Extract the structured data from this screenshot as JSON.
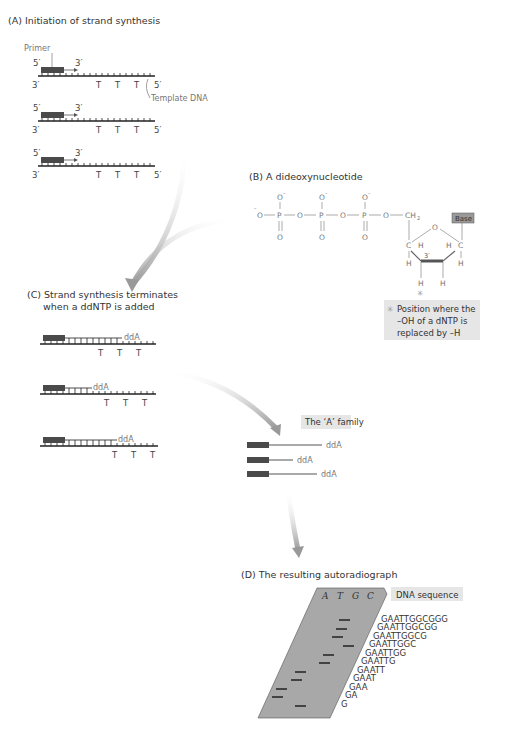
{
  "panels": {
    "A": {
      "title": "(A) Initiation of strand synthesis",
      "primer_label": "Primer",
      "template_label": "Template DNA",
      "five_prime": "5′",
      "three_prime": "3′",
      "template_bases": [
        "T",
        "T",
        "T"
      ],
      "strand_count": 3
    },
    "B": {
      "title": "(B) A dideoxynucleotide",
      "atoms": {
        "O": "O",
        "O_minus": "O",
        "P": "P",
        "CH2": "CH",
        "C": "C",
        "H": "H",
        "three_prime": "3′"
      },
      "base_label": "Base",
      "asterisk": "✳",
      "note_lines": [
        "Position where the",
        "–OH of a dNTP is",
        "replaced by –H"
      ]
    },
    "C": {
      "title_line1": "(C) Strand synthesis terminates",
      "title_line2": "when a ddNTP is added",
      "terminator": "ddA",
      "template_bases": [
        "T",
        "T",
        "T"
      ]
    },
    "family": {
      "title": "The ‘A’ family",
      "fragments": [
        "ddA",
        "ddA",
        "ddA"
      ]
    },
    "D": {
      "title": "(D) The resulting autoradiograph",
      "lanes": [
        "A",
        "T",
        "G",
        "C"
      ],
      "sequence_label": "DNA sequence",
      "ladder": [
        "GAATTGGCGGG",
        "GAATTGGCGG",
        "GAATTGGCG",
        "GAATTGGC",
        "GAATTGG",
        "GAATTG",
        "GAATT",
        "GAAT",
        "GAA",
        "GA",
        "G"
      ]
    }
  },
  "colors": {
    "primer": "#4a4a4a",
    "strand": "#222222",
    "arrow": "#b0b0b0",
    "gel": "#a8a8a8",
    "label_box": "#e6e6e6",
    "base_box": "#9a9a9a"
  }
}
